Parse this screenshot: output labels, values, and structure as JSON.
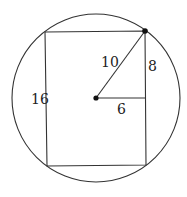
{
  "diagram": {
    "type": "geometry",
    "colors": {
      "stroke": "#333333",
      "dot": "#111111",
      "text": "#222222",
      "background": "#ffffff"
    },
    "circle": {
      "cx": 96,
      "cy": 98,
      "r": 84
    },
    "center_point": {
      "x": 96,
      "y": 98
    },
    "vertex_point": {
      "x": 145,
      "y": 31
    },
    "rectangle": {
      "top_left": {
        "x": 45,
        "y": 32
      },
      "top_right": {
        "x": 145,
        "y": 31
      },
      "bottom_right": {
        "x": 146,
        "y": 165
      },
      "bottom_left": {
        "x": 47,
        "y": 166
      }
    },
    "segments": {
      "radius": {
        "from": "center",
        "to": "vertex",
        "label": "10"
      },
      "half_width": {
        "from": "center",
        "to": "right-side",
        "label": "6"
      },
      "half_height": {
        "from": "right-side-midpoint",
        "to": "vertex",
        "label": "8"
      },
      "rect_height": {
        "side": "left",
        "label": "16"
      }
    },
    "labels": {
      "left_side": "16",
      "radius": "10",
      "vertical": "8",
      "horizontal": "6"
    }
  }
}
